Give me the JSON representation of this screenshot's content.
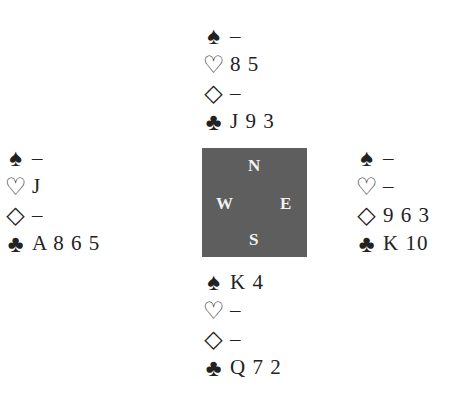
{
  "diagram": {
    "type": "bridge-deal",
    "suit_symbols": {
      "spades": "♠",
      "hearts": "♡",
      "diamonds": "◇",
      "clubs": "♣"
    },
    "compass": {
      "north": "N",
      "south": "S",
      "east": "E",
      "west": "W"
    },
    "hands": {
      "north": {
        "spades": "–",
        "hearts": "8 5",
        "diamonds": "–",
        "clubs": "J 9 3"
      },
      "west": {
        "spades": "–",
        "hearts": "J",
        "diamonds": "–",
        "clubs": "A 8 6 5"
      },
      "east": {
        "spades": "–",
        "hearts": "–",
        "diamonds": "9 6 3",
        "clubs": "K 10"
      },
      "south": {
        "spades": "K 4",
        "hearts": "–",
        "diamonds": "–",
        "clubs": "Q 7 2"
      }
    }
  }
}
